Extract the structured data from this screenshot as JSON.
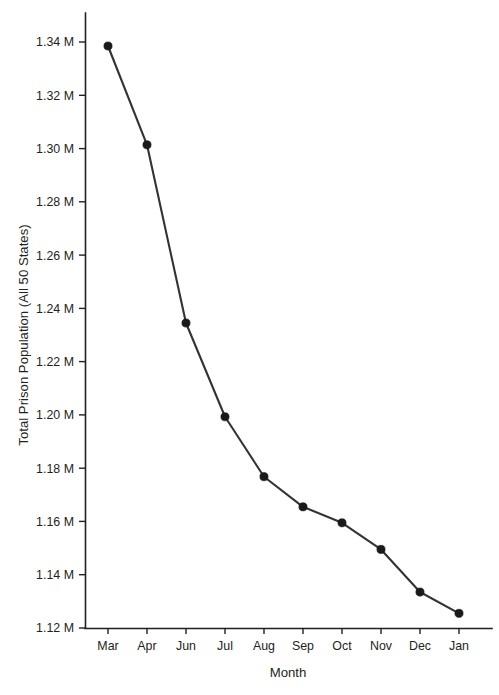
{
  "chart_data": {
    "type": "line",
    "title": "",
    "xlabel": "Month",
    "ylabel": "Total Prison Population (All 50 States)",
    "categories": [
      "Mar",
      "Apr",
      "Jun",
      "Jul",
      "Aug",
      "Sep",
      "Oct",
      "Nov",
      "Dec",
      "Jan"
    ],
    "values": [
      1338500,
      1301400,
      1234500,
      1199300,
      1176800,
      1165500,
      1159500,
      1149500,
      1133500,
      1125500
    ],
    "value_labels": [
      "1.3385 M",
      "1.3014 M",
      "1.2345 M",
      "1.1993 M",
      "1.1768 M",
      "1.1655 M",
      "1.1595 M",
      "1.1495 M",
      "1.1335 M",
      "1.1255 M"
    ],
    "series": [
      {
        "name": "Total Prison Population",
        "values": [
          1338500,
          1301400,
          1234500,
          1199300,
          1176800,
          1165500,
          1159500,
          1149500,
          1133500,
          1125500
        ]
      }
    ],
    "ylim": [
      1120000,
      1345000
    ],
    "yticks": [
      1120000,
      1140000,
      1160000,
      1180000,
      1200000,
      1220000,
      1240000,
      1260000,
      1280000,
      1300000,
      1320000,
      1340000
    ],
    "ytick_labels": [
      "1.12 M",
      "1.14 M",
      "1.16 M",
      "1.18 M",
      "1.20 M",
      "1.22 M",
      "1.24 M",
      "1.26 M",
      "1.28 M",
      "1.30 M",
      "1.32 M",
      "1.34 M"
    ],
    "xtick_labels": [
      "Mar",
      "Apr",
      "Jun",
      "Jul",
      "Aug",
      "Sep",
      "Oct",
      "Nov",
      "Dec",
      "Jan"
    ],
    "grid": false,
    "legend": false,
    "legend_position": "none",
    "line_color": "#333333",
    "marker_color": "#1a1a1a",
    "marker_shape": "circle",
    "axis_color": "#231f20",
    "background_color": "#ffffff"
  }
}
